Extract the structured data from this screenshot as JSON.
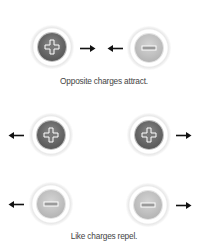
{
  "attract": {
    "caption": "Opposite charges attract.",
    "charges": [
      {
        "sign": "positive",
        "symbol": "+",
        "cx": 52,
        "cy": 47,
        "arrow": "right",
        "arrow_x": 80
      },
      {
        "sign": "negative",
        "symbol": "−",
        "cx": 149,
        "cy": 48,
        "arrow": "left",
        "arrow_x": 107
      }
    ]
  },
  "repel": {
    "caption": "Like charges repel.",
    "charges": [
      {
        "sign": "positive",
        "symbol": "+",
        "cx": 51,
        "cy": 135,
        "arrow": "left"
      },
      {
        "sign": "positive",
        "symbol": "+",
        "cx": 149,
        "cy": 135,
        "arrow": "right"
      },
      {
        "sign": "negative",
        "symbol": "−",
        "cx": 51,
        "cy": 204,
        "arrow": "left"
      },
      {
        "sign": "negative",
        "symbol": "−",
        "cx": 148,
        "cy": 205,
        "arrow": "right"
      }
    ]
  },
  "colors": {
    "positive_core": "#6a6a6a",
    "negative_core": "#c0c0c0",
    "arrow": "#111111",
    "text": "#444444"
  }
}
